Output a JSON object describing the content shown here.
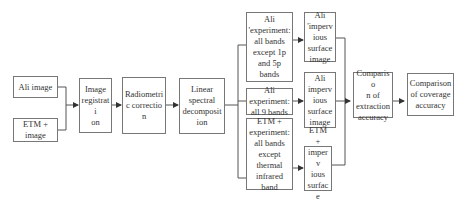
{
  "diagram": {
    "nodes": {
      "ali_image": {
        "label": "Ali image"
      },
      "etm_image": {
        "label": "ETM +\nimage"
      },
      "image_registration": {
        "label": "Image\nregistrati\non"
      },
      "radiometric_correction": {
        "label": "Radiometri\nc correction"
      },
      "linear_spectral": {
        "label": "Linear\nspectral\ndecomposit\nion"
      },
      "ali_exp_1": {
        "label": "Ali\n'experiment:\nall bands\nexcept 1p\nand 5p\nbands"
      },
      "ali_exp_2": {
        "label": "Ali\nexperiment:\nall 9 bands"
      },
      "etm_exp": {
        "label": "ETM +\nexperiment:\nall bands\nexcept\nthermal\ninfrared\nband"
      },
      "ali_imperv_1": {
        "label": "Ali\n'imperv\nious\nsurface\nimage"
      },
      "ali_imperv_2": {
        "label": "Ali\nimperv\nious\nsurface\nimage"
      },
      "etm_imperv": {
        "label": "ETM +\nimperv\nious\nsurface\nimage"
      },
      "comparison_extraction": {
        "label": "Compariso\nn of\nextraction\naccuracy"
      },
      "comparison_coverage": {
        "label": "Comparison\nof coverage\naccuracy"
      }
    },
    "edges": [
      [
        "ali_image",
        "image_registration"
      ],
      [
        "etm_image",
        "image_registration"
      ],
      [
        "image_registration",
        "radiometric_correction"
      ],
      [
        "radiometric_correction",
        "linear_spectral"
      ],
      [
        "linear_spectral",
        "ali_exp_1"
      ],
      [
        "linear_spectral",
        "ali_exp_2"
      ],
      [
        "linear_spectral",
        "etm_exp"
      ],
      [
        "ali_exp_1",
        "ali_imperv_1"
      ],
      [
        "ali_exp_2",
        "ali_imperv_2"
      ],
      [
        "etm_exp",
        "etm_imperv"
      ],
      [
        "ali_imperv_1",
        "comparison_extraction"
      ],
      [
        "ali_imperv_2",
        "comparison_extraction"
      ],
      [
        "etm_imperv",
        "comparison_extraction"
      ],
      [
        "comparison_extraction",
        "comparison_coverage"
      ]
    ]
  }
}
